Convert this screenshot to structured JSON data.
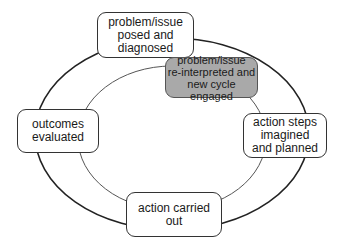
{
  "diagram": {
    "type": "cycle",
    "outer_loop": {
      "nodes": [
        {
          "id": "posed",
          "label": "problem/issue\nposed and\ndiagnosed"
        },
        {
          "id": "planned",
          "label": "action steps\nimagined\nand planned"
        },
        {
          "id": "carried",
          "label": "action carried\nout"
        },
        {
          "id": "evaluated",
          "label": "outcomes\nevaluated"
        }
      ]
    },
    "inner_loop": {
      "nodes": [
        {
          "id": "reinterpreted",
          "label": "problem/issue\nre-interpreted and\nnew cycle engaged",
          "highlighted": true
        }
      ]
    },
    "colors": {
      "line": "#222222",
      "inner_line": "#555555",
      "highlight_fill": "#a9a9a9",
      "box_fill": "#ffffff"
    }
  }
}
